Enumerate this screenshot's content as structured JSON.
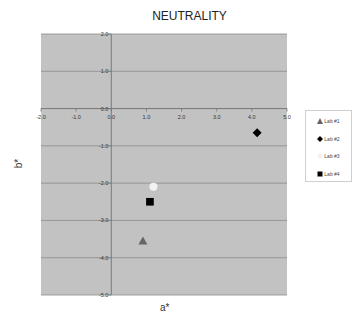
{
  "chart_data": {
    "type": "scatter",
    "title": "NEUTRALITY",
    "xlabel": "a*",
    "ylabel": "b*",
    "xlim": [
      -2.0,
      5.0
    ],
    "ylim": [
      -5.0,
      2.0
    ],
    "xticks": [
      "-2.0",
      "-1.0",
      "0.0",
      "1.0",
      "2.0",
      "3.0",
      "4.0",
      "5.0"
    ],
    "yticks": [
      "2.0",
      "1.0",
      "0.0",
      "-1.0",
      "-2.0",
      "-3.0",
      "-4.0",
      "-5.0"
    ],
    "grid": true,
    "legend_position": "right",
    "series": [
      {
        "name": "Lab #1",
        "marker": "triangle",
        "color": "#666666",
        "points": [
          {
            "x": 0.9,
            "y": -3.55
          }
        ]
      },
      {
        "name": "Lab #2",
        "marker": "diamond",
        "color": "#000000",
        "points": [
          {
            "x": 4.15,
            "y": -0.65
          }
        ]
      },
      {
        "name": "Lab #3",
        "marker": "circle",
        "color": "#f2f2f2",
        "points": [
          {
            "x": 1.2,
            "y": -2.1
          }
        ]
      },
      {
        "name": "Lab #4",
        "marker": "square",
        "color": "#000000",
        "points": [
          {
            "x": 1.1,
            "y": -2.5
          }
        ]
      }
    ]
  },
  "colors": {
    "plot_background": "#c2c2c2",
    "gridline": "#8a8a8a",
    "axis": "#7a7a7a"
  }
}
